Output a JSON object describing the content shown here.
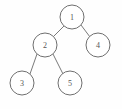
{
  "figure": {
    "kind": "binary-tree-diagram",
    "background_color": "#fefefe",
    "node_fill_color": "#ffffff",
    "node_stroke_color": "#6f6f6f",
    "edge_color": "#7a7a7a",
    "label_color": "#555555",
    "width": 122,
    "height": 109
  },
  "nodes": [
    {
      "id": "n1",
      "label": "1",
      "cx": 72,
      "cy": 17,
      "r": 12,
      "role": "root"
    },
    {
      "id": "n2",
      "label": "2",
      "cx": 45,
      "cy": 45,
      "r": 12,
      "role": "left-child-of-1"
    },
    {
      "id": "n4",
      "label": "4",
      "cx": 98,
      "cy": 45,
      "r": 12,
      "role": "right-child-of-1"
    },
    {
      "id": "n3",
      "label": "3",
      "cx": 22,
      "cy": 83,
      "r": 12,
      "role": "left-child-of-2"
    },
    {
      "id": "n5",
      "label": "5",
      "cx": 70,
      "cy": 83,
      "r": 12,
      "role": "right-child-of-2"
    }
  ],
  "edges": [
    {
      "id": "e1",
      "from": "n1",
      "to": "n2",
      "x1": 64,
      "y1": 26,
      "x2": 53,
      "y2": 37
    },
    {
      "id": "e2",
      "from": "n1",
      "to": "n4",
      "x1": 81,
      "y1": 25,
      "x2": 90,
      "y2": 37
    },
    {
      "id": "e3",
      "from": "n2",
      "to": "n3",
      "x1": 37,
      "y1": 54,
      "x2": 30,
      "y2": 74
    },
    {
      "id": "e4",
      "from": "n2",
      "to": "n5",
      "x1": 53,
      "y1": 54,
      "x2": 63,
      "y2": 74
    }
  ]
}
